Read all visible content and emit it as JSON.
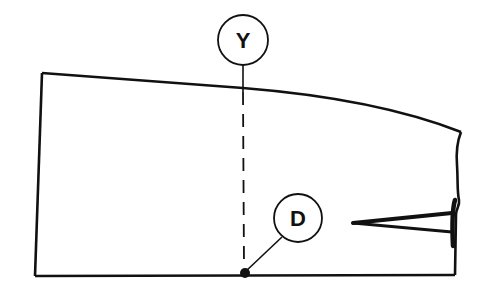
{
  "diagram": {
    "labels": {
      "y": "Y",
      "d": "D"
    },
    "colors": {
      "line": "#111111",
      "background": "#ffffff"
    }
  }
}
